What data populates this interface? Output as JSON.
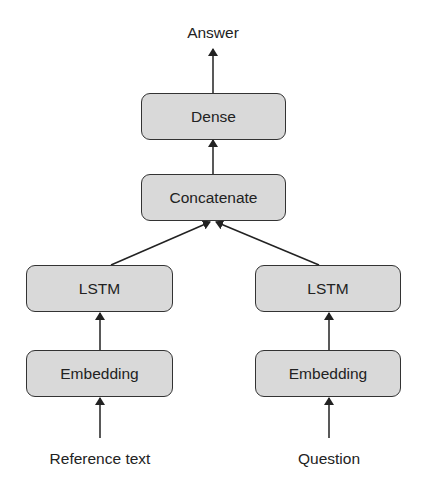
{
  "diagram": {
    "title": "",
    "output_label": "Answer",
    "nodes": {
      "dense": "Dense",
      "concatenate": "Concatenate",
      "lstm_left": "LSTM",
      "lstm_right": "LSTM",
      "embedding_left": "Embedding",
      "embedding_right": "Embedding"
    },
    "inputs": {
      "left": "Reference text",
      "right": "Question"
    },
    "edges": [
      {
        "from": "Reference text",
        "to": "embedding_left"
      },
      {
        "from": "Question",
        "to": "embedding_right"
      },
      {
        "from": "embedding_left",
        "to": "lstm_left"
      },
      {
        "from": "embedding_right",
        "to": "lstm_right"
      },
      {
        "from": "lstm_left",
        "to": "concatenate"
      },
      {
        "from": "lstm_right",
        "to": "concatenate"
      },
      {
        "from": "concatenate",
        "to": "dense"
      },
      {
        "from": "dense",
        "to": "Answer"
      }
    ],
    "colors": {
      "box_fill": "#d9d9d9",
      "box_border": "#333333",
      "arrow": "#222222"
    }
  }
}
